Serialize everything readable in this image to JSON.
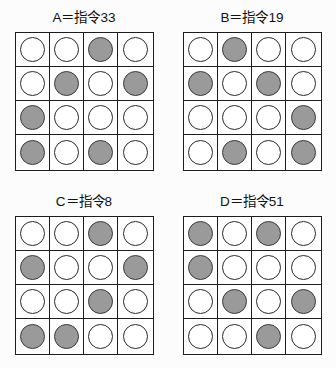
{
  "figure": {
    "background_color": "#fcfcfc",
    "empty_fill_color": "#ffffff",
    "filled_fill_color": "#9a9a9a",
    "outline_color": "#1d1d1d"
  },
  "legend": {
    "filled_state_label": "filled",
    "empty_state_label": "empty"
  },
  "panels": [
    {
      "id": "A",
      "title": "A＝指令33",
      "rows": [
        [
          "empty",
          "empty",
          "filled",
          "empty"
        ],
        [
          "empty",
          "filled",
          "empty",
          "filled"
        ],
        [
          "filled",
          "empty",
          "empty",
          "empty"
        ],
        [
          "filled",
          "empty",
          "filled",
          "empty"
        ]
      ]
    },
    {
      "id": "B",
      "title": "B＝指令19",
      "rows": [
        [
          "empty",
          "filled",
          "empty",
          "empty"
        ],
        [
          "filled",
          "empty",
          "filled",
          "empty"
        ],
        [
          "empty",
          "empty",
          "empty",
          "filled"
        ],
        [
          "empty",
          "filled",
          "empty",
          "filled"
        ]
      ]
    },
    {
      "id": "C",
      "title": "C＝指令8",
      "rows": [
        [
          "empty",
          "empty",
          "filled",
          "empty"
        ],
        [
          "filled",
          "empty",
          "empty",
          "filled"
        ],
        [
          "empty",
          "empty",
          "filled",
          "empty"
        ],
        [
          "filled",
          "filled",
          "empty",
          "empty"
        ]
      ]
    },
    {
      "id": "D",
      "title": "D＝指令51",
      "rows": [
        [
          "filled",
          "empty",
          "filled",
          "empty"
        ],
        [
          "filled",
          "empty",
          "empty",
          "empty"
        ],
        [
          "empty",
          "filled",
          "empty",
          "filled"
        ],
        [
          "empty",
          "empty",
          "filled",
          "empty"
        ]
      ]
    }
  ]
}
